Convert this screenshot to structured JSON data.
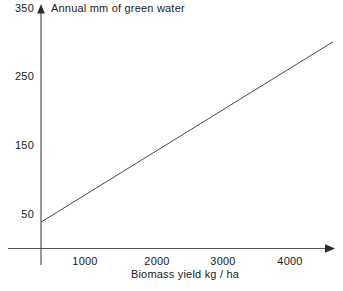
{
  "chart_data": {
    "type": "line",
    "title": "",
    "xlabel": "Biomass yield kg / ha",
    "ylabel": "Annual mm of green water",
    "xlim": [
      0,
      4300
    ],
    "ylim": [
      0,
      350
    ],
    "grid": false,
    "legend": null,
    "x_ticks": [
      {
        "value": 1000,
        "label": "1000"
      },
      {
        "value": 2000,
        "label": "2000"
      },
      {
        "value": 3000,
        "label": "3000"
      },
      {
        "value": 4000,
        "label": "4000"
      }
    ],
    "y_ticks": [
      {
        "value": 350,
        "label": "350"
      },
      {
        "value": 250,
        "label": "250"
      },
      {
        "value": 150,
        "label": "150"
      },
      {
        "value": 50,
        "label": "50"
      }
    ],
    "series": [
      {
        "name": "green water vs biomass yield",
        "x": [
          0,
          4300
        ],
        "values": [
          37,
          300
        ]
      }
    ]
  },
  "axes": {
    "y_axis_arrow": "up-arrow",
    "x_axis_arrow": "right-arrow"
  }
}
